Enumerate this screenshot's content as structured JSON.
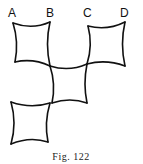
{
  "figure": {
    "caption": "Fig. 122",
    "labels": [
      "A",
      "B",
      "C",
      "D"
    ],
    "square_count": 4
  }
}
